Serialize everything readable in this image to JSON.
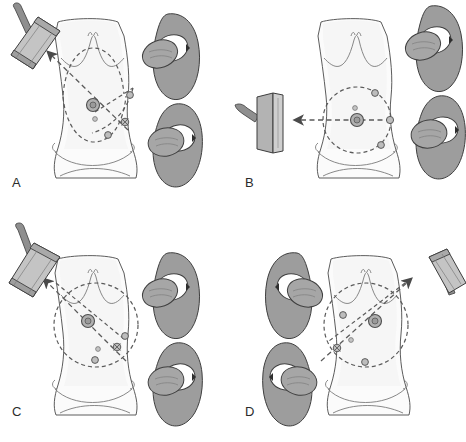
{
  "figure": {
    "width": 466,
    "height": 442,
    "background_color": "#ffffff"
  },
  "palette": {
    "outline": "#4a4a4a",
    "bone_fill": "#9d9d9d",
    "bone_outline": "#3f3f3f",
    "femoral_head_fill": "#a6a6a6",
    "acetabulum_fill": "#ffffff",
    "skin_fill": "#fbfbfb",
    "skin_shadow": "#f2f2f2",
    "probe_fill": "#b8b8b8",
    "probe_face": "#cfcfcf",
    "probe_edge": "#3d3d3d",
    "cable_fill": "#8f8f8f",
    "dashed_line": "#5a5a5a",
    "port_fill": "#b0b0b0",
    "port_outline": "#4f4f4f",
    "label_color": "#2b2b2b"
  },
  "panels": [
    {
      "id": "A",
      "label": "A",
      "probe": {
        "name": "ultrasound-probe",
        "orientation": "oblique-upper-left",
        "cable_direction": "up",
        "position": "outside-left-upper"
      },
      "arrow": {
        "name": "probe-direction-arrow",
        "direction": "toward-upper-left",
        "style": "dashed-with-arrowhead"
      },
      "torso": {
        "view": "anterior-abdomen",
        "landmarks": [
          "costal-margin",
          "iliac-crest",
          "pubic-symphysis"
        ]
      },
      "ports": [
        {
          "name": "umbilical-port",
          "size": "large",
          "x": 93,
          "y": 105
        },
        {
          "name": "secondary-marker",
          "size": "tiny",
          "x": 95,
          "y": 119
        },
        {
          "name": "right-lateral-port",
          "size": "small",
          "x": 130,
          "y": 95
        },
        {
          "name": "suprapubic-port",
          "size": "small",
          "x": 108,
          "y": 135
        },
        {
          "name": "target-crosshair-port",
          "size": "cross",
          "x": 125,
          "y": 122
        }
      ],
      "trajectories": [
        {
          "name": "dashed-arc-upper",
          "kind": "arc"
        },
        {
          "name": "dashed-arc-lower",
          "kind": "arc"
        },
        {
          "name": "dashed-line-to-probe",
          "kind": "straight"
        }
      ],
      "pelvis": {
        "side": "right",
        "count": 2,
        "hips": [
          {
            "name": "upper-hip-joint",
            "orientation": "oblique"
          },
          {
            "name": "lower-hip-joint",
            "orientation": "oblique"
          }
        ]
      }
    },
    {
      "id": "B",
      "label": "B",
      "probe": {
        "name": "ultrasound-probe",
        "orientation": "vertical-flat",
        "cable_direction": "left",
        "position": "outside-left-middle"
      },
      "arrow": {
        "name": "probe-direction-arrow",
        "direction": "toward-left-horizontal",
        "style": "dashed-with-arrowhead"
      },
      "torso": {
        "view": "anterior-abdomen",
        "landmarks": [
          "costal-margin",
          "iliac-crest",
          "pubic-symphysis"
        ]
      },
      "ports": [
        {
          "name": "umbilical-port",
          "size": "large",
          "x": 60,
          "y": 120
        },
        {
          "name": "secondary-marker",
          "size": "tiny",
          "x": 58,
          "y": 108
        },
        {
          "name": "upper-right-port",
          "size": "small",
          "x": 104,
          "y": 93
        },
        {
          "name": "right-lateral-port",
          "size": "small",
          "x": 117,
          "y": 120
        },
        {
          "name": "lower-right-port",
          "size": "small",
          "x": 110,
          "y": 146
        }
      ],
      "trajectories": [
        {
          "name": "dashed-circle",
          "kind": "circle"
        },
        {
          "name": "dashed-line-horizontal",
          "kind": "straight"
        }
      ],
      "pelvis": {
        "side": "right",
        "count": 2,
        "hips": [
          {
            "name": "upper-hip-joint",
            "orientation": "oblique"
          },
          {
            "name": "lower-hip-joint",
            "orientation": "oblique"
          }
        ]
      }
    },
    {
      "id": "C",
      "label": "C",
      "probe": {
        "name": "ultrasound-probe",
        "orientation": "oblique-upper-left",
        "cable_direction": "up",
        "position": "outside-left-upper"
      },
      "arrow": {
        "name": "probe-direction-arrow",
        "direction": "toward-upper-left",
        "style": "dashed-with-arrowhead"
      },
      "torso": {
        "view": "anterior-abdomen",
        "landmarks": [
          "costal-margin",
          "iliac-crest",
          "pubic-symphysis"
        ]
      },
      "ports": [
        {
          "name": "umbilical-port",
          "size": "large",
          "x": 88,
          "y": 100
        },
        {
          "name": "secondary-marker",
          "size": "tiny",
          "x": 98,
          "y": 128
        },
        {
          "name": "right-lateral-port",
          "size": "small",
          "x": 125,
          "y": 115
        },
        {
          "name": "lower-port",
          "size": "small",
          "x": 95,
          "y": 139
        },
        {
          "name": "target-crosshair-port",
          "size": "cross",
          "x": 117,
          "y": 126
        }
      ],
      "trajectories": [
        {
          "name": "dashed-circle",
          "kind": "circle"
        },
        {
          "name": "dashed-line-to-probe",
          "kind": "straight"
        },
        {
          "name": "dashed-line-crossing",
          "kind": "straight"
        }
      ],
      "pelvis": {
        "side": "right",
        "count": 2,
        "hips": [
          {
            "name": "upper-hip-joint",
            "orientation": "oblique"
          },
          {
            "name": "lower-hip-joint",
            "orientation": "oblique"
          }
        ]
      }
    },
    {
      "id": "D",
      "label": "D",
      "probe": {
        "name": "ultrasound-probe",
        "orientation": "oblique-upper-right",
        "cable_direction": "right",
        "position": "outside-right-upper"
      },
      "arrow": {
        "name": "probe-direction-arrow",
        "direction": "toward-upper-right",
        "style": "dashed-with-arrowhead"
      },
      "torso": {
        "view": "anterior-abdomen",
        "landmarks": [
          "costal-margin",
          "iliac-crest",
          "pubic-symphysis"
        ]
      },
      "ports": [
        {
          "name": "umbilical-port",
          "size": "large",
          "x": 128,
          "y": 105
        },
        {
          "name": "secondary-marker",
          "size": "tiny",
          "x": 103,
          "y": 119
        },
        {
          "name": "left-lateral-port",
          "size": "small",
          "x": 88,
          "y": 94
        },
        {
          "name": "lower-port",
          "size": "small",
          "x": 110,
          "y": 141
        },
        {
          "name": "target-crosshair-port",
          "size": "cross",
          "x": 93,
          "y": 127
        }
      ],
      "trajectories": [
        {
          "name": "dashed-circle",
          "kind": "circle"
        },
        {
          "name": "dashed-line-to-probe",
          "kind": "straight"
        },
        {
          "name": "dashed-line-crossing",
          "kind": "straight"
        }
      ],
      "pelvis": {
        "side": "left",
        "count": 2,
        "hips": [
          {
            "name": "upper-hip-joint",
            "orientation": "oblique"
          },
          {
            "name": "lower-hip-joint",
            "orientation": "oblique"
          }
        ]
      }
    }
  ]
}
